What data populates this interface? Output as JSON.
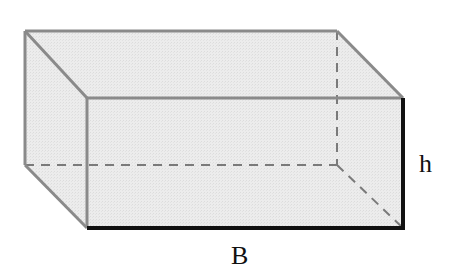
{
  "diagram": {
    "type": "rectangular-prism",
    "labels": {
      "height": "h",
      "base": "B"
    },
    "colors": {
      "fill": "#ececec",
      "edge": "#8a8a8a",
      "hidden_edge": "#7a7a7a",
      "highlight_edge": "#111111",
      "text": "#111111"
    }
  }
}
